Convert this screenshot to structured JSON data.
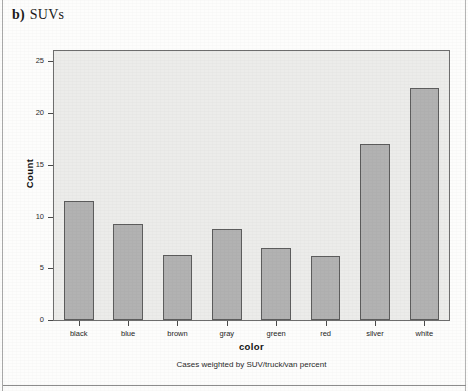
{
  "caption": {
    "label": "b)",
    "title": "SUVs"
  },
  "chart_data": {
    "type": "bar",
    "title": "SUVs",
    "categories": [
      "black",
      "blue",
      "brown",
      "gray",
      "green",
      "red",
      "silver",
      "white"
    ],
    "values": [
      11.5,
      9.3,
      6.3,
      8.8,
      7.0,
      6.2,
      17.0,
      22.4
    ],
    "xlabel": "color",
    "ylabel": "Count",
    "ylim": [
      0,
      26
    ],
    "ytick_labels": [
      "0",
      "5",
      "10",
      "15",
      "20",
      "25"
    ],
    "ytick_values": [
      0,
      5,
      10,
      15,
      20,
      25
    ],
    "grid": false,
    "legend": null,
    "footnote": "Cases weighted by SUV/truck/van percent",
    "bar_fill_color": "#b2b2b2",
    "bar_edge_color": "#5d5d5d",
    "plot_background_color": "#ececea"
  }
}
